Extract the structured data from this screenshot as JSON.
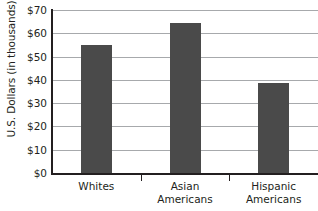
{
  "chart_data": {
    "type": "bar",
    "title": "",
    "xlabel": "",
    "ylabel": "U.S. Dollars (in thousands)",
    "categories": [
      "Whites",
      "Asian Americans",
      "Hispanic Americans"
    ],
    "category_lines": [
      [
        "Whites"
      ],
      [
        "Asian",
        "Americans"
      ],
      [
        "Hispanic",
        "Americans"
      ]
    ],
    "values": [
      55,
      64.5,
      38.5
    ],
    "ylim": [
      0,
      70
    ],
    "ytick_step": 10,
    "ytick_labels": [
      "$70",
      "$60",
      "$50",
      "$40",
      "$30",
      "$20",
      "$10",
      "$0"
    ],
    "ytick_values": [
      70,
      60,
      50,
      40,
      30,
      20,
      10,
      0
    ],
    "grid": true,
    "legend": false,
    "bar_color": "#4a4a4a",
    "grid_color": "#a7a9ac",
    "axis_color": "#231f20",
    "background_color": "#ffffff"
  }
}
